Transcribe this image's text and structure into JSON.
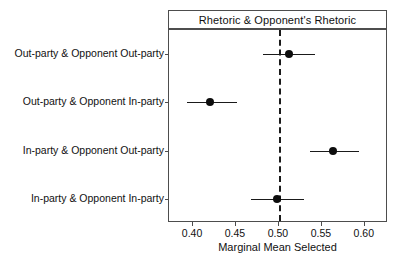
{
  "chart_data": {
    "type": "scatter",
    "subtype": "dot-and-whisker marginal means plot",
    "title": "Rhetoric & Opponent's Rhetoric",
    "xlabel": "Marginal Mean Selected",
    "ylabel": "",
    "xlim": [
      0.372,
      0.627
    ],
    "xticks": [
      0.4,
      0.45,
      0.5,
      0.55,
      0.6
    ],
    "xtick_labels": [
      "0.40",
      "0.45",
      "0.50",
      "0.55",
      "0.60"
    ],
    "grid": false,
    "legend": null,
    "reference_line": {
      "value": 0.5,
      "orientation": "vertical",
      "style": "dashed",
      "color": "#1a1a1a"
    },
    "categories": [
      "Out-party & Opponent Out-party",
      "Out-party & Opponent In-party",
      "In-party & Opponent Out-party",
      "In-party & Opponent In-party"
    ],
    "values": [
      0.512,
      0.42,
      0.563,
      0.498
    ],
    "ci_low": [
      0.481,
      0.393,
      0.536,
      0.468
    ],
    "ci_high": [
      0.542,
      0.451,
      0.593,
      0.529
    ],
    "points": [
      {
        "label": "Out-party & Opponent Out-party",
        "value": 0.512,
        "ci_low": 0.481,
        "ci_high": 0.542
      },
      {
        "label": "Out-party & Opponent In-party",
        "value": 0.42,
        "ci_low": 0.393,
        "ci_high": 0.451
      },
      {
        "label": "In-party & Opponent Out-party",
        "value": 0.563,
        "ci_low": 0.536,
        "ci_high": 0.593
      },
      {
        "label": "In-party & Opponent In-party",
        "value": 0.498,
        "ci_low": 0.468,
        "ci_high": 0.529
      }
    ],
    "colors": {
      "point": "#0d0d0d",
      "errorbar": "#1a1a1a",
      "refline": "#1a1a1a",
      "axis": "#4d4d4d",
      "background": "#ffffff"
    }
  }
}
